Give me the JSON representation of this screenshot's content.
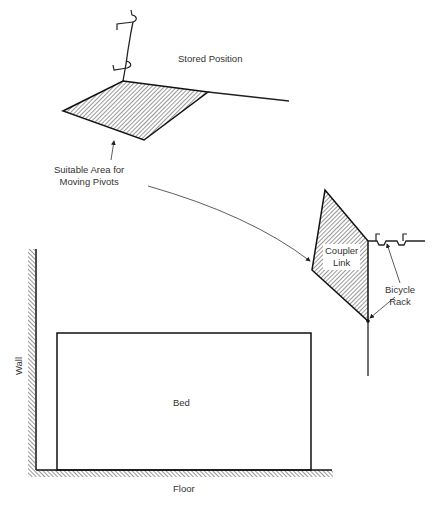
{
  "diagram": {
    "type": "mechanism-sketch",
    "labels": {
      "stored_position": "Stored Position",
      "suitable_area_line1": "Suitable Area for",
      "suitable_area_line2": "Moving Pivots",
      "coupler_line1": "Coupler",
      "coupler_line2": "Link",
      "bicycle_line1": "Bicycle",
      "bicycle_line2": "Rack",
      "bed": "Bed",
      "wall": "Wall",
      "floor": "Floor"
    },
    "colors": {
      "line": "#1a1a1a",
      "hatch": "#333333",
      "background": "#ffffff"
    }
  }
}
